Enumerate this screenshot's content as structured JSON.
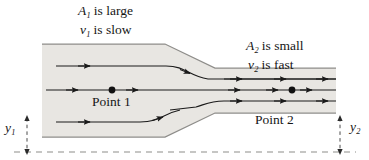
{
  "figure": {
    "labels": {
      "a1_symbol": "A",
      "a1_sub": "1",
      "a1_text": " is large",
      "v1_symbol": "v",
      "v1_sub": "1",
      "v1_text": " is slow",
      "a2_symbol": "A",
      "a2_sub": "2",
      "a2_text": " is small",
      "v2_symbol": "v",
      "v2_sub": "2",
      "v2_text": " is fast",
      "point1": "Point 1",
      "point2": "Point 2",
      "y1_symbol": "y",
      "y1_sub": "1",
      "y2_symbol": "y",
      "y2_sub": "2"
    },
    "colors": {
      "fluid_fill": "#e8e6e2",
      "wall_stroke": "#8e8d8a",
      "streamline_stroke": "#1a1a1a",
      "text": "#161616",
      "datum_dashed": "#8e8d8a"
    },
    "geometry": {
      "wide_top_y": 44,
      "wide_bottom_y": 137,
      "narrow_top_y": 68,
      "narrow_bottom_y": 113,
      "transition_start_x": 165,
      "transition_end_x": 215,
      "pipe_left_x": 42,
      "pipe_right_x": 336,
      "center_y": 90
    },
    "streamlines": [
      {
        "name": "upper-streamline",
        "arrow_count": 2
      },
      {
        "name": "upper-mid-streamline",
        "arrow_count": 3
      },
      {
        "name": "center-streamline",
        "arrow_count": 5
      },
      {
        "name": "lower-mid-streamline",
        "arrow_count": 3
      },
      {
        "name": "lower-streamline",
        "arrow_count": 2
      }
    ],
    "markers": [
      {
        "name": "point-1-dot",
        "x": 112,
        "y": 90
      },
      {
        "name": "point-2-dot",
        "x": 292,
        "y": 90
      }
    ]
  }
}
